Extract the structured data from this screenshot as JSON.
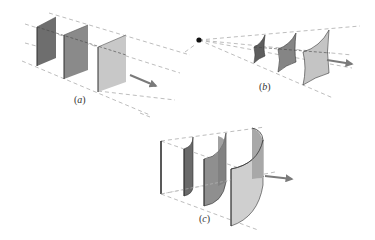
{
  "figure": {
    "panels": [
      {
        "id": "a",
        "label_open": "(",
        "label_letter": "a",
        "label_close": ")",
        "description": "plane wavefronts"
      },
      {
        "id": "b",
        "label_open": "(",
        "label_letter": "b",
        "label_close": ")",
        "description": "spherical wavefronts from point source"
      },
      {
        "id": "c",
        "label_open": "(",
        "label_letter": "c",
        "label_close": ")",
        "description": "cylindrical wavefronts from line source"
      }
    ],
    "icons": {
      "propagation_arrow": "arrow-right-icon",
      "point_source": "point-source-dot-icon"
    },
    "colors": {
      "background": "#ffffff",
      "dark_front": "#6e6e6e",
      "mid_front": "#8f8f8f",
      "light_front": "#c4c4c4",
      "edge": "#3a3a3a",
      "dashed_line": "#9a9a9a",
      "arrow": "#7a7a7a",
      "source": "#111111"
    }
  }
}
